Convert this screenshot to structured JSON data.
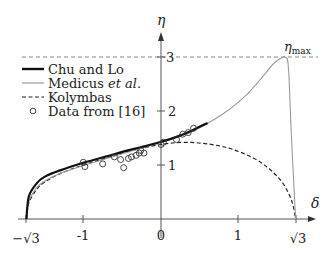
{
  "chart_data": {
    "type": "line",
    "title": "",
    "xlabel": "δ",
    "ylabel": "η",
    "xlim": [
      -1.732,
      1.9
    ],
    "ylim": [
      0,
      3.3
    ],
    "grid": false,
    "legend_position": "upper-left",
    "x_ticks": [
      {
        "value": -1.732,
        "label": "−√3"
      },
      {
        "value": -1,
        "label": "-1"
      },
      {
        "value": 0,
        "label": "0"
      },
      {
        "value": 1,
        "label": "1"
      },
      {
        "value": 1.732,
        "label": "√3"
      }
    ],
    "y_ticks": [
      {
        "value": 1,
        "label": "1"
      },
      {
        "value": 2,
        "label": "2"
      },
      {
        "value": 3,
        "label": "3"
      }
    ],
    "annotations": [
      {
        "text": "ηmax",
        "base": "η",
        "subscript": "max",
        "x": 1.6,
        "y": 3.0,
        "note": "horizontal dashed reference line at η = 3"
      }
    ],
    "series": [
      {
        "name": "Chu and Lo",
        "style": "solid-thick",
        "color": "#111111",
        "x": [
          -1.732,
          -1.7,
          -1.6,
          -1.5,
          -1.3,
          -1.0,
          -0.7,
          -0.4,
          -0.2,
          0.0,
          0.2,
          0.4,
          0.6
        ],
        "y": [
          0.0,
          0.42,
          0.66,
          0.78,
          0.9,
          1.04,
          1.16,
          1.28,
          1.35,
          1.43,
          1.52,
          1.64,
          1.78
        ]
      },
      {
        "name": "Medicus et al.",
        "style": "solid-thin",
        "color": "#9a9a9a",
        "x": [
          -1.732,
          -1.7,
          -1.6,
          -1.5,
          -1.3,
          -1.0,
          -0.7,
          -0.4,
          0.0,
          0.4,
          0.8,
          1.1,
          1.3,
          1.45,
          1.55,
          1.6,
          1.64,
          1.68,
          1.732
        ],
        "y": [
          0.0,
          0.32,
          0.58,
          0.7,
          0.84,
          0.99,
          1.12,
          1.25,
          1.42,
          1.62,
          1.95,
          2.3,
          2.62,
          2.88,
          2.98,
          3.0,
          2.8,
          1.5,
          0.0
        ]
      },
      {
        "name": "Kolymbas",
        "style": "dashed",
        "color": "#222222",
        "x": [
          -1.732,
          -1.7,
          -1.6,
          -1.5,
          -1.3,
          -1.0,
          -0.7,
          -0.4,
          0.0,
          0.3,
          0.6,
          0.9,
          1.2,
          1.4,
          1.55,
          1.65,
          1.7,
          1.732
        ],
        "y": [
          0.0,
          0.3,
          0.55,
          0.68,
          0.84,
          1.0,
          1.13,
          1.26,
          1.38,
          1.42,
          1.39,
          1.3,
          1.12,
          0.92,
          0.7,
          0.45,
          0.25,
          0.0
        ]
      },
      {
        "name": "Data from [16]",
        "style": "markers-open-circle",
        "color": "#333333",
        "x": [
          -1.0,
          -0.98,
          -0.75,
          -0.6,
          -0.52,
          -0.48,
          -0.42,
          -0.38,
          -0.32,
          -0.28,
          -0.26,
          -0.22,
          0.0,
          0.03,
          0.2,
          0.28,
          0.35,
          0.42
        ],
        "y": [
          1.05,
          0.97,
          1.02,
          1.15,
          1.1,
          0.95,
          1.12,
          1.15,
          1.18,
          1.22,
          1.27,
          1.22,
          1.38,
          1.42,
          1.47,
          1.57,
          1.6,
          1.68
        ]
      }
    ],
    "legend": [
      {
        "label": "Chu and Lo",
        "style": "solid-thick"
      },
      {
        "label_main": "Medicus ",
        "label_italic": "et al.",
        "style": "solid-thin"
      },
      {
        "label": "Kolymbas",
        "style": "dashed"
      },
      {
        "label": "Data from [16]",
        "style": "marker"
      }
    ]
  },
  "axes": {
    "x_label": "δ",
    "y_label": "η",
    "eta_max_base": "η",
    "eta_max_sub": "max"
  }
}
